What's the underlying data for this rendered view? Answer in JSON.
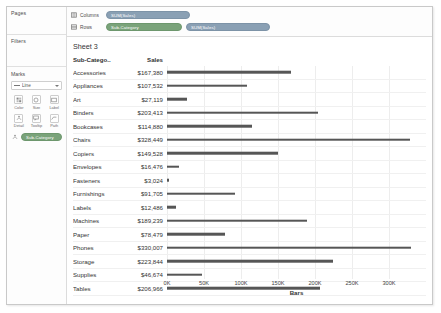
{
  "window": {
    "sheet_title": "Sheet 3"
  },
  "sidebar": {
    "pages_label": "Pages",
    "filters_label": "Filters",
    "marks": {
      "title": "Marks",
      "type_label": "Line",
      "type_icon": "line-mark-icon",
      "buttons": [
        {
          "label": "Color",
          "icon": "color-icon"
        },
        {
          "label": "Size",
          "icon": "size-icon"
        },
        {
          "label": "Label",
          "icon": "label-icon"
        },
        {
          "label": "Detail",
          "icon": "detail-icon"
        },
        {
          "label": "Tooltip",
          "icon": "tooltip-icon"
        },
        {
          "label": "Path",
          "icon": "path-icon"
        }
      ],
      "detail_pill": {
        "label": "Sub-Category",
        "color": "#7aa37a",
        "icon": "detail-icon"
      }
    }
  },
  "shelves": [
    {
      "name": "Columns",
      "icon": "columns-icon",
      "pills": [
        {
          "label": "SUM(Sales)",
          "type": "measure",
          "color": "#8aa0b4"
        }
      ]
    },
    {
      "name": "Rows",
      "icon": "rows-icon",
      "pills": [
        {
          "label": "Sub-Category",
          "type": "dimension",
          "color": "#7aa37a"
        },
        {
          "label": "SUM(Sales)",
          "type": "measure",
          "color": "#8aa0b4"
        }
      ]
    }
  ],
  "table": {
    "headers": {
      "category": "Sub-Catego..",
      "sales": "Sales"
    },
    "rows": [
      {
        "category": "Accessories",
        "sales": "$167,380",
        "value": 167380
      },
      {
        "category": "Appliances",
        "sales": "$107,532",
        "value": 107532
      },
      {
        "category": "Art",
        "sales": "$27,119",
        "value": 27119
      },
      {
        "category": "Binders",
        "sales": "$203,413",
        "value": 203413
      },
      {
        "category": "Bookcases",
        "sales": "$114,880",
        "value": 114880
      },
      {
        "category": "Chairs",
        "sales": "$328,449",
        "value": 328449
      },
      {
        "category": "Copiers",
        "sales": "$149,528",
        "value": 149528
      },
      {
        "category": "Envelopes",
        "sales": "$16,476",
        "value": 16476
      },
      {
        "category": "Fasteners",
        "sales": "$3,024",
        "value": 3024
      },
      {
        "category": "Furnishings",
        "sales": "$91,705",
        "value": 91705
      },
      {
        "category": "Labels",
        "sales": "$12,486",
        "value": 12486
      },
      {
        "category": "Machines",
        "sales": "$189,239",
        "value": 189239
      },
      {
        "category": "Paper",
        "sales": "$78,479",
        "value": 78479
      },
      {
        "category": "Phones",
        "sales": "$330,007",
        "value": 330007
      },
      {
        "category": "Storage",
        "sales": "$223,844",
        "value": 223844
      },
      {
        "category": "Supplies",
        "sales": "$46,674",
        "value": 46674
      },
      {
        "category": "Tables",
        "sales": "$206,966",
        "value": 206966
      }
    ]
  },
  "chart_data": {
    "type": "bar",
    "orientation": "horizontal",
    "title": "Sheet 3",
    "xlabel": "Bars",
    "ylabel": "Sub-Category",
    "categories": [
      "Accessories",
      "Appliances",
      "Art",
      "Binders",
      "Bookcases",
      "Chairs",
      "Copiers",
      "Envelopes",
      "Fasteners",
      "Furnishings",
      "Labels",
      "Machines",
      "Paper",
      "Phones",
      "Storage",
      "Supplies",
      "Tables"
    ],
    "values": [
      167380,
      107532,
      27119,
      203413,
      114880,
      328449,
      149528,
      16476,
      3024,
      91705,
      12486,
      189239,
      78479,
      330007,
      223844,
      46674,
      206966
    ],
    "value_labels": [
      "$167,380",
      "$107,532",
      "$27,119",
      "$203,413",
      "$114,880",
      "$328,449",
      "$149,528",
      "$16,476",
      "$3,024",
      "$91,705",
      "$12,486",
      "$189,239",
      "$78,479",
      "$330,007",
      "$223,844",
      "$46,674",
      "$206,966"
    ],
    "xlim": [
      0,
      350000
    ],
    "tick_values": [
      0,
      50000,
      100000,
      150000,
      200000,
      250000,
      300000
    ],
    "tick_labels": [
      "0K",
      "50K",
      "100K",
      "150K",
      "200K",
      "250K",
      "300K"
    ],
    "grid": true,
    "legend": null,
    "bar_color": "#565656"
  }
}
